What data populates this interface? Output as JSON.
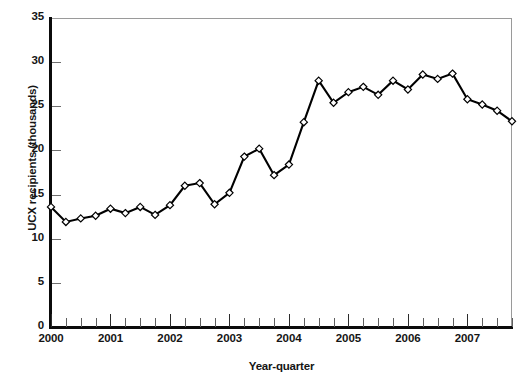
{
  "chart_data": {
    "type": "line",
    "title": "",
    "xlabel": "Year-quarter",
    "ylabel": "UCX recipients (thousands)",
    "ylim": [
      0,
      35
    ],
    "yticks": [
      0,
      5,
      10,
      15,
      20,
      25,
      30,
      35
    ],
    "ytick_labels": [
      "0",
      "5",
      "10",
      "15",
      "20",
      "25",
      "30",
      "35"
    ],
    "xlim": [
      "2000 Q1",
      "2007 Q4"
    ],
    "xtick_labels": [
      "2000",
      "2001",
      "2002",
      "2003",
      "2004",
      "2005",
      "2006",
      "2007"
    ],
    "xtick_label_positions": [
      0,
      4,
      8,
      12,
      16,
      20,
      24,
      28
    ],
    "minor_ticks_per_year": 4,
    "grid": false,
    "legend": null,
    "marker": "diamond-open",
    "line_color": "#000000",
    "marker_fill": "#ffffff",
    "marker_edge": "#000000",
    "categories": [
      "2000 Q1",
      "2000 Q2",
      "2000 Q3",
      "2000 Q4",
      "2001 Q1",
      "2001 Q2",
      "2001 Q3",
      "2001 Q4",
      "2002 Q1",
      "2002 Q2",
      "2002 Q3",
      "2002 Q4",
      "2003 Q1",
      "2003 Q2",
      "2003 Q3",
      "2003 Q4",
      "2004 Q1",
      "2004 Q2",
      "2004 Q3",
      "2004 Q4",
      "2005 Q1",
      "2005 Q2",
      "2005 Q3",
      "2005 Q4",
      "2006 Q1",
      "2006 Q2",
      "2006 Q3",
      "2006 Q4",
      "2007 Q1",
      "2007 Q2",
      "2007 Q3",
      "2007 Q4"
    ],
    "values": [
      13.6,
      11.9,
      12.3,
      12.6,
      13.4,
      12.9,
      13.6,
      12.7,
      13.8,
      16.0,
      16.3,
      13.9,
      15.2,
      19.3,
      20.2,
      17.2,
      18.4,
      23.2,
      27.9,
      25.4,
      26.6,
      27.2,
      26.3,
      27.9,
      26.9,
      28.6,
      28.1,
      28.7,
      25.8,
      25.2,
      24.5,
      23.3
    ]
  },
  "axes": {
    "y_title": "UCX recipients (thousands)",
    "x_title": "Year-quarter"
  },
  "colors": {
    "line": "#000000",
    "axis": "#0b0b0b",
    "frame": "#9a9a9a",
    "background": "#ffffff",
    "text": "#151515"
  }
}
